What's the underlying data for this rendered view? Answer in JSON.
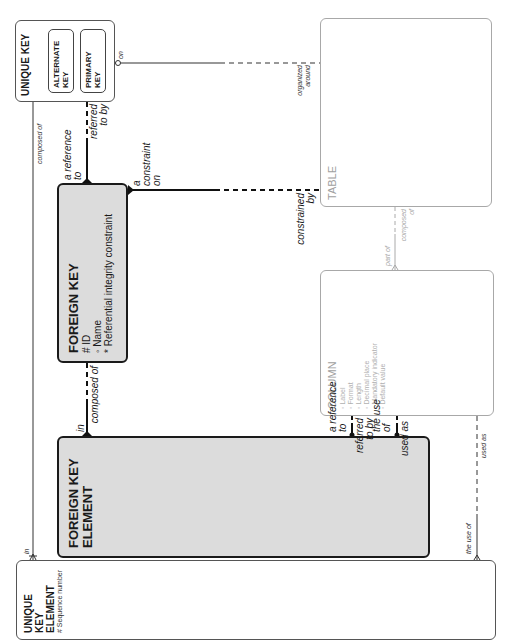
{
  "diagram": {
    "orientation": "rotated-90-ccw",
    "entities": {
      "unique_key": {
        "name": "UNIQUE KEY",
        "subtypes": [
          {
            "name": "ALTERNATE KEY"
          },
          {
            "name": "PRIMARY KEY"
          }
        ]
      },
      "table": {
        "name": "TABLE"
      },
      "foreign_key": {
        "name": "FOREIGN KEY",
        "attributes": [
          "# ID",
          "◦ Name",
          "* Referential integrity constraint"
        ]
      },
      "column": {
        "name": "COLUMN",
        "attributes": [
          "◦ Label",
          "◦ Format",
          "◦ Length",
          "◦ Decimal place",
          "◦ Mandatory indicator",
          "◦ Default value"
        ]
      },
      "foreign_key_element": {
        "name": "FOREIGN KEY ELEMENT"
      },
      "unique_key_element": {
        "name": "UNIQUE KEY ELEMENT",
        "attributes": [
          "# Sequence number"
        ]
      }
    },
    "relationships": {
      "uk_table": {
        "from_label": "on",
        "to_label": "organized around"
      },
      "uk_uke": {
        "from_label": "composed of",
        "to_label": "in"
      },
      "uk_fk": {
        "from_label": "referred to by",
        "to_label": "a reference to"
      },
      "fk_table": {
        "from_label": "a constraint on",
        "to_label": "constrained by"
      },
      "fk_fke": {
        "from_label": "composed of",
        "to_label": "in"
      },
      "table_column": {
        "from_label": "composed of",
        "to_label": "part of"
      },
      "column_fke_ref": {
        "from_label": "referred to by",
        "to_label": "a reference to"
      },
      "column_fke_use": {
        "from_label": "used as",
        "to_label": "the use of"
      },
      "column_uke_use": {
        "from_label": "used as",
        "to_label": "the use of"
      }
    }
  }
}
